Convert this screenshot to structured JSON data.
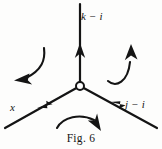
{
  "figure": {
    "caption": "Fig. 6",
    "background_color": "#fdfdfc",
    "ink_color": "#141414",
    "width": 162,
    "height": 149
  },
  "vertex": {
    "name": "trivalent-vertex",
    "style": "open-circle",
    "x": 80,
    "y": 86,
    "radius": 4,
    "fill": "#ffffff",
    "stroke": "#141414"
  },
  "edges": [
    {
      "id": "edge-top",
      "label": "k − i",
      "direction": "outgoing",
      "arrow": "up",
      "from": [
        80,
        86
      ],
      "to": [
        80,
        4
      ]
    },
    {
      "id": "edge-lower-left",
      "label": "x",
      "direction": "incoming",
      "arrow": "up-right",
      "from": [
        6,
        127
      ],
      "to": [
        80,
        86
      ]
    },
    {
      "id": "edge-lower-right",
      "label": "j − i",
      "direction": "incoming",
      "arrow": "up-left",
      "from": [
        156,
        127
      ],
      "to": [
        80,
        86
      ]
    }
  ],
  "rotation_arrows": [
    {
      "id": "arrow-left",
      "position": "upper-left",
      "arrow": "points-down-left",
      "sense": "counterclockwise"
    },
    {
      "id": "arrow-right",
      "position": "upper-right",
      "arrow": "points-up",
      "sense": "counterclockwise"
    },
    {
      "id": "arrow-bottom",
      "position": "lower-center",
      "arrow": "points-down-right",
      "sense": "clockwise"
    }
  ]
}
